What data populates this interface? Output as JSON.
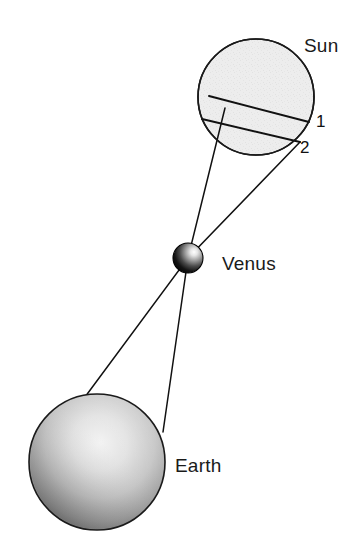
{
  "figure": {
    "background_color": "#ffffff",
    "width": 358,
    "height": 550
  },
  "labels": {
    "sun": "Sun",
    "venus": "Venus",
    "earth": "Earth",
    "transit_path_1": "1",
    "transit_path_2": "2"
  },
  "bodies": {
    "sun": {
      "name": "Sun",
      "center_x": 256,
      "center_y": 97,
      "radius": 58,
      "fill_color": "#ededed",
      "stroke_color": "#1a1a1a",
      "stroke_width": 1.6
    },
    "venus": {
      "name": "Venus",
      "center_x": 188,
      "center_y": 258,
      "radius": 15,
      "fill_dark": "#0a0a0a",
      "fill_light": "#d8d8d8",
      "stroke_color": "#000000"
    },
    "earth": {
      "name": "Earth",
      "center_x": 97,
      "center_y": 462,
      "radius": 68,
      "fill_dark": "#4a4a4a",
      "fill_light": "#e8e8e8",
      "stroke_color": "#1a1a1a"
    }
  },
  "sight_lines": [
    {
      "id": "sight-line-a",
      "from_label": "Earth north observer",
      "from_x": 85,
      "from_y": 397,
      "through_x": 188,
      "through_y": 258,
      "to_x": 225,
      "to_y": 108,
      "stroke_color": "#111111",
      "stroke_width": 1.5
    },
    {
      "id": "sight-line-b",
      "from_label": "Earth south observer",
      "from_x": 163,
      "from_y": 432,
      "through_x": 188,
      "through_y": 258,
      "to_x": 300,
      "to_y": 142,
      "stroke_color": "#111111",
      "stroke_width": 1.5
    }
  ],
  "transit_chords": [
    {
      "id": "transit-chord-1",
      "label": "1",
      "x1": 209,
      "y1": 96,
      "x2": 309,
      "y2": 122,
      "stroke_color": "#111111",
      "stroke_width": 2.0
    },
    {
      "id": "transit-chord-2",
      "label": "2",
      "x1": 202,
      "y1": 119,
      "x2": 300,
      "y2": 142,
      "stroke_color": "#111111",
      "stroke_width": 2.0
    }
  ]
}
